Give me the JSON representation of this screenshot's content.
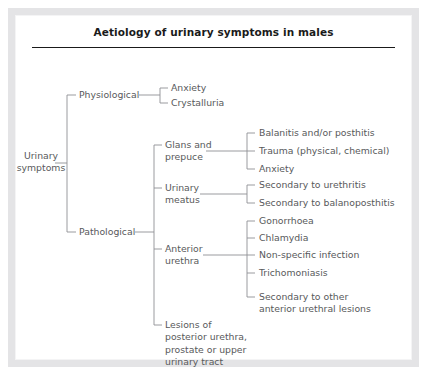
{
  "figure": {
    "title": "Aetiology of urinary symptoms in males",
    "type": "tree-diagram",
    "text_color": "#58595b",
    "title_color": "#1a1a1a",
    "line_color": "#8e9094",
    "frame_color": "#e4e4e6",
    "background": "#ffffff"
  },
  "tree": {
    "root": {
      "id": "urinary-symptoms",
      "label": "Urinary\nsymptoms"
    },
    "level1": [
      {
        "id": "physiological",
        "label": "Physiological"
      },
      {
        "id": "pathological",
        "label": "Pathological"
      }
    ],
    "physiological_children": [
      {
        "id": "anxiety-physiological",
        "label": "Anxiety"
      },
      {
        "id": "crystalluria",
        "label": "Crystalluria"
      }
    ],
    "pathological_children": [
      {
        "id": "glans-and-prepuce",
        "label": "Glans and\nprepuce"
      },
      {
        "id": "urinary-meatus",
        "label": "Urinary\nmeatus"
      },
      {
        "id": "anterior-urethra",
        "label": "Anterior\nurethra"
      },
      {
        "id": "lesions-posterior-urethra",
        "label": "Lesions of\nposterior urethra,\nprostate or upper\nurinary tract"
      }
    ],
    "glans_and_prepuce_children": [
      {
        "id": "balanitis-posthitis",
        "label": "Balanitis and/or posthitis"
      },
      {
        "id": "trauma",
        "label": "Trauma (physical, chemical)"
      },
      {
        "id": "anxiety-glans",
        "label": "Anxiety"
      }
    ],
    "urinary_meatus_children": [
      {
        "id": "secondary-urethritis",
        "label": "Secondary to urethritis"
      },
      {
        "id": "secondary-balanoposthitis",
        "label": "Secondary to balanoposthitis"
      }
    ],
    "anterior_urethra_children": [
      {
        "id": "gonorrhoea",
        "label": "Gonorrhoea"
      },
      {
        "id": "chlamydia",
        "label": "Chlamydia"
      },
      {
        "id": "non-specific-infection",
        "label": "Non-specific infection"
      },
      {
        "id": "trichomoniasis",
        "label": "Trichomoniasis"
      },
      {
        "id": "secondary-other-anterior",
        "label": "Secondary to other\nanterior urethral lesions"
      }
    ]
  }
}
